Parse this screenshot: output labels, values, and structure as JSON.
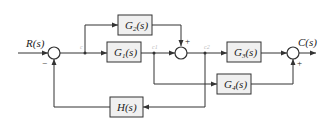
{
  "diagram": {
    "type": "block-diagram",
    "input": "R(s)",
    "output": "C(s)",
    "nodes": {
      "n1": "c",
      "n2": "c1",
      "n3": "c2"
    },
    "blocks": {
      "g1": "G1(s)",
      "g2": "G2(s)",
      "g3": "G3(s)",
      "g4": "G4(s)",
      "h": "H(s)"
    },
    "signs": {
      "sum1_feedback": "−",
      "sum2_g2": "+",
      "sum3_g4": "+"
    }
  }
}
